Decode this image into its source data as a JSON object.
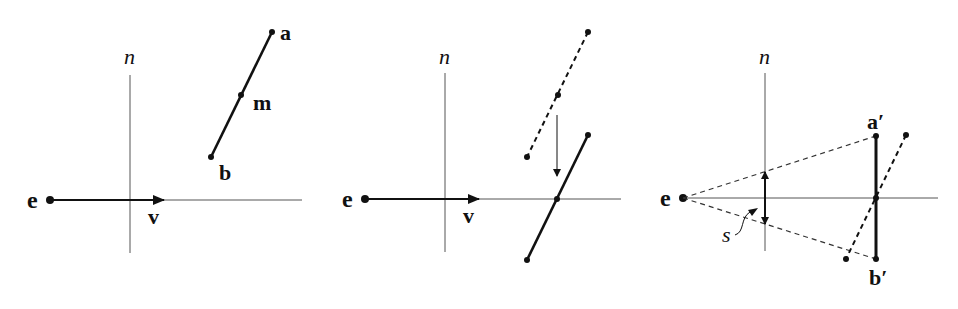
{
  "figure": {
    "colors": {
      "ink": "#111111",
      "axis": "#555555",
      "background": "#ffffff"
    }
  },
  "panels": [
    {
      "id": "panel-1",
      "labels": {
        "normal": "n",
        "eye": "e",
        "view": "v",
        "a": "a",
        "m": "m",
        "b": "b"
      },
      "points": {
        "e": [
          50,
          200
        ],
        "a": [
          272,
          32
        ],
        "m": [
          241,
          95
        ],
        "b": [
          211,
          157
        ]
      },
      "axes": {
        "horizontal": {
          "y": 200,
          "x_end": 302
        },
        "vertical": {
          "x": 130,
          "y_top": 75,
          "y_bottom": 253
        }
      },
      "view_arrow_tip": [
        164,
        200
      ]
    },
    {
      "id": "panel-2",
      "labels": {
        "normal": "n",
        "eye": "e",
        "view": "v"
      },
      "points": {
        "e": [
          365,
          200
        ],
        "original_top": [
          588,
          32
        ],
        "original_mid": [
          558,
          95
        ],
        "original_bottom": [
          527,
          157
        ],
        "moved_top": [
          588,
          135
        ],
        "moved_mid": [
          557,
          199
        ],
        "moved_bottom": [
          527,
          260
        ]
      },
      "axes": {
        "horizontal": {
          "y": 199,
          "x_end": 621
        },
        "vertical": {
          "x": 445,
          "y_top": 73,
          "y_bottom": 252
        }
      },
      "view_arrow_tip": [
        479,
        199
      ],
      "translate_arrow": {
        "from": [
          557,
          115
        ],
        "to": [
          557,
          176
        ]
      }
    },
    {
      "id": "panel-3",
      "labels": {
        "normal": "n",
        "eye": "e",
        "a_prime": "a′",
        "b_prime": "b′",
        "size": "s"
      },
      "points": {
        "e": [
          683,
          198
        ],
        "a_prime": [
          876,
          136
        ],
        "b_prime": [
          876,
          259
        ],
        "center": [
          876,
          198
        ],
        "tilted_top": [
          906,
          135
        ],
        "tilted_bottom": [
          846,
          259
        ]
      },
      "axes": {
        "horizontal": {
          "y": 198,
          "x_end": 938
        },
        "vertical": {
          "x": 765,
          "y_top": 73,
          "y_bottom": 251
        }
      },
      "size_arrow": {
        "x": 765,
        "y_top": 172,
        "y_bottom": 224
      }
    }
  ]
}
